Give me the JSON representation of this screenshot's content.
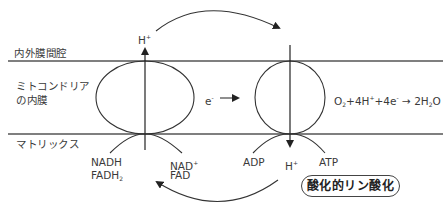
{
  "regions": {
    "intermembrane_space": "内外膜間腔",
    "inner_membrane_line1": "ミトコンドリア",
    "inner_membrane_line2": "の内膜",
    "matrix": "マトリックス"
  },
  "left_complex": {
    "proton_out": {
      "base": "H",
      "sup": "+"
    },
    "substrates": [
      {
        "base": "NADH",
        "sub": ""
      },
      {
        "base": "FADH",
        "sub": "2"
      }
    ],
    "products": [
      {
        "base": "NAD",
        "sup": "+"
      },
      {
        "base": "FAD",
        "sup": ""
      }
    ]
  },
  "electron_flow": {
    "base": "e",
    "sup": "-"
  },
  "right_complex": {
    "reaction": {
      "o2": "O",
      "o2_sub": "2",
      "h_part": "+4H",
      "h_sup": "+",
      "e_part": "+4e",
      "e_sup": "-",
      "arrow": "→",
      "product": "2H",
      "product_sub": "2",
      "product_end": "O"
    },
    "adp": "ADP",
    "proton_in": {
      "base": "H",
      "sup": "+"
    },
    "atp": "ATP"
  },
  "process_label": "酸化的リン酸化",
  "colors": {
    "line": "#3a3a3a",
    "text": "#3a3a3a",
    "background": "#ffffff"
  }
}
